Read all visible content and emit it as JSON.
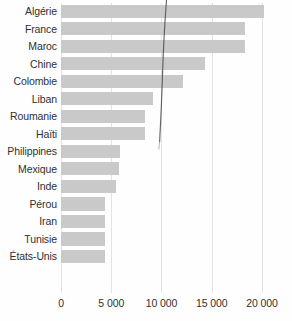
{
  "chart_data": {
    "type": "bar",
    "orientation": "horizontal",
    "title": "",
    "subtitle": "",
    "xlabel": "",
    "ylabel": "",
    "xlim": [
      0,
      21000
    ],
    "ylim": null,
    "grid": true,
    "legend": null,
    "legend_position": "none",
    "xticks": [
      0,
      5000,
      10000,
      15000,
      20000
    ],
    "xtick_labels": [
      "0",
      "5 000",
      "10 000",
      "15 000",
      "20 000"
    ],
    "categories": [
      "Algérie",
      "France",
      "Maroc",
      "Chine",
      "Colombie",
      "Liban",
      "Roumanie",
      "Haïti",
      "Philippines",
      "Mexique",
      "Inde",
      "Pérou",
      "Iran",
      "Tunisie",
      "États-Unis"
    ],
    "values": [
      20250,
      18350,
      18300,
      14350,
      12150,
      9150,
      8400,
      8350,
      5850,
      5800,
      5450,
      4400,
      4400,
      4350,
      4350
    ],
    "series": [
      {
        "name": "",
        "values": [
          20250,
          18350,
          18300,
          14350,
          12150,
          9150,
          8400,
          8350,
          5850,
          5800,
          5450,
          4400,
          4400,
          4350,
          4350
        ]
      }
    ],
    "annotations": []
  },
  "style": {
    "bar_color": "#c9c9c9",
    "grid_color": "#e3e3e3",
    "text_color": "#303030",
    "background": "#fefefe",
    "artifact_color": "#4a4a4a"
  }
}
